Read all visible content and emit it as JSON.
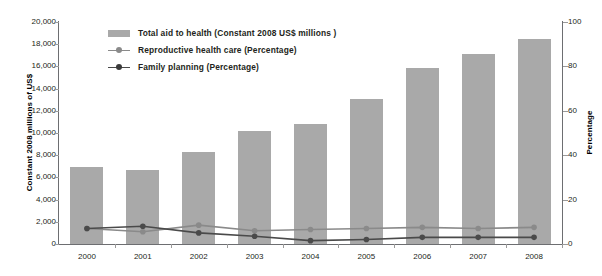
{
  "chart_data": {
    "type": "bar",
    "title": "",
    "subtitle": "",
    "categories": [
      "2000",
      "2001",
      "2002",
      "2003",
      "2004",
      "2005",
      "2006",
      "2007",
      "2008"
    ],
    "xlabel": "",
    "ylabel": "Constant 2008 millions of US$",
    "ylabel_right": "Percentage",
    "ylim": [
      0,
      20000
    ],
    "ylim_right": [
      0,
      100
    ],
    "yticks": [
      "0",
      "2,000",
      "4,000",
      "6,000",
      "8,000",
      "10,000",
      "12,000",
      "14,000",
      "16,000",
      "18,000",
      "20,000"
    ],
    "ytick_values": [
      0,
      2000,
      4000,
      6000,
      8000,
      10000,
      12000,
      14000,
      16000,
      18000,
      20000
    ],
    "yticks_right": [
      "0",
      "20",
      "40",
      "60",
      "80",
      "100"
    ],
    "ytick_values_right": [
      0,
      20,
      40,
      60,
      80,
      100
    ],
    "grid": false,
    "legend_position": "top-left-inside",
    "series": [
      {
        "name": "Total aid to health (Constant 2008 US$ millions )",
        "type": "bar",
        "axis": "left",
        "color": "#a9a9a9",
        "values": [
          6900,
          6700,
          8300,
          10200,
          10800,
          13100,
          15900,
          17100,
          18500
        ]
      },
      {
        "name": "Reproductive health care (Percentage)",
        "type": "line",
        "axis": "right",
        "color": "#8a8a8a",
        "values": [
          7.0,
          5.5,
          8.5,
          6.0,
          6.5,
          7.0,
          7.5,
          7.0,
          7.5
        ]
      },
      {
        "name": "Family planning (Percentage)",
        "type": "line",
        "axis": "right",
        "color": "#4a4a4a",
        "values": [
          7.0,
          8.0,
          5.0,
          3.5,
          1.5,
          2.0,
          3.0,
          3.0,
          3.0
        ]
      }
    ]
  }
}
